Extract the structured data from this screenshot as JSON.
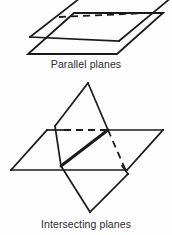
{
  "figure": {
    "background_color": "#fefefe",
    "stroke_color": "#1a1a1a",
    "text_color": "#2b2b2b",
    "panels": [
      {
        "id": "parallel-planes",
        "caption": "Parallel planes",
        "description": "Two stacked parallelograms drawn in oblique projection representing two parallel planes, the upper plane partially clipped by the top edge of the figure, with the hidden back edge of the upper plane drawn as a dashed line."
      },
      {
        "id": "intersecting-planes",
        "caption": "Intersecting planes",
        "description": "Two parallelograms crossing each other: one drawn as a near-horizontal plane and one tilted plane, with the line of intersection drawn as a thick solid segment and hidden edges drawn dashed."
      }
    ]
  },
  "captions": {
    "parallel": "Parallel planes",
    "intersecting": "Intersecting planes"
  },
  "geometry": {
    "parallel_planes": {
      "top_plane": {
        "front_left": [
          32,
          36
        ],
        "front_right": [
          118,
          40
        ],
        "back_right": [
          163,
          13
        ],
        "back_left": [
          60,
          17
        ],
        "hidden_edges": [
          "back_left-back_right"
        ]
      },
      "bottom_plane": {
        "front_left": [
          30,
          54
        ],
        "front_right": [
          117,
          54
        ],
        "back_right": [
          163,
          25
        ],
        "back_left": [
          46,
          25
        ],
        "hidden_edges": []
      }
    },
    "intersecting_planes": {
      "horizontal_plane": {
        "front_left": [
          11,
          170
        ],
        "front_right": [
          127,
          170
        ],
        "back_right": [
          160,
          130
        ],
        "back_left": [
          47,
          130
        ],
        "hidden_edges": [
          "back_left-back_right"
        ]
      },
      "tilted_plane": {
        "top_vertex": [
          88,
          83
        ],
        "left_vertex": [
          55,
          126
        ],
        "bottom_vertex": [
          90,
          212
        ],
        "right_vertex": [
          128,
          174
        ],
        "hidden_edges": [
          "left_vertex-right_vertex"
        ]
      },
      "intersection_line": {
        "from": [
          61,
          166
        ],
        "to": [
          108,
          130
        ],
        "style": "thick-solid"
      }
    }
  }
}
